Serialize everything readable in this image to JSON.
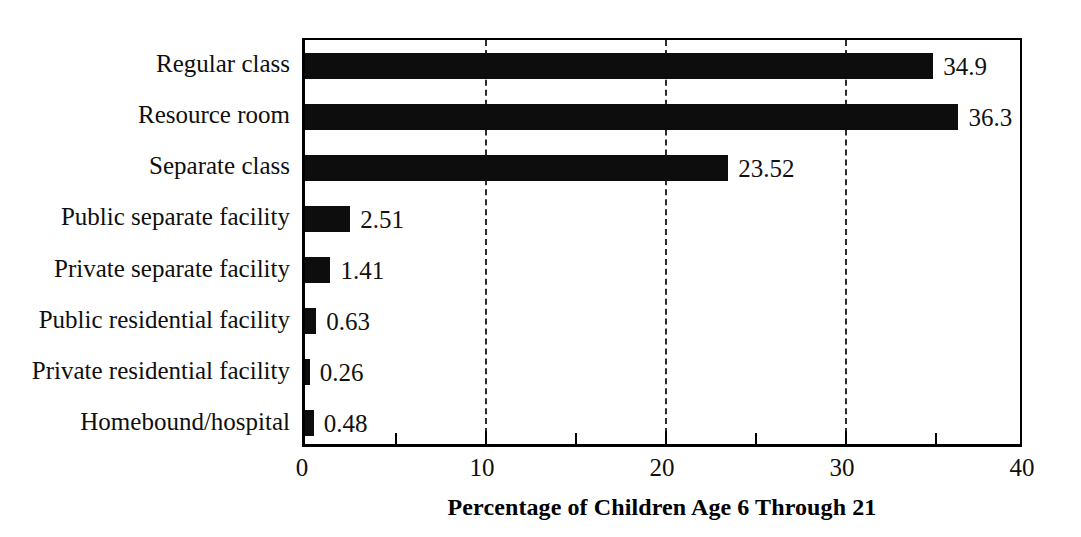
{
  "chart_data": {
    "type": "bar",
    "orientation": "horizontal",
    "title": "",
    "xlabel": "Percentage of Children Age 6 Through 21",
    "ylabel": "",
    "xlim": [
      0,
      40
    ],
    "xticks": [
      "0",
      "10",
      "20",
      "30",
      "40"
    ],
    "xtick_values": [
      0,
      10,
      20,
      30,
      40
    ],
    "minor_tick_values": [
      5,
      15,
      25,
      35
    ],
    "gridlines": [
      10,
      20,
      30
    ],
    "grid": true,
    "grid_style": "dashed-vertical",
    "legend": null,
    "bar_color": "#0d0d0d",
    "categories": [
      "Regular class",
      "Resource room",
      "Separate class",
      "Public separate facility",
      "Private separate facility",
      "Public residential facility",
      "Private residential facility",
      "Homebound/hospital"
    ],
    "values": [
      34.9,
      36.3,
      23.52,
      2.51,
      1.41,
      0.63,
      0.26,
      0.48
    ],
    "value_labels": [
      "34.9",
      "36.3",
      "23.52",
      "2.51",
      "1.41",
      "0.63",
      "0.26",
      "0.48"
    ]
  }
}
